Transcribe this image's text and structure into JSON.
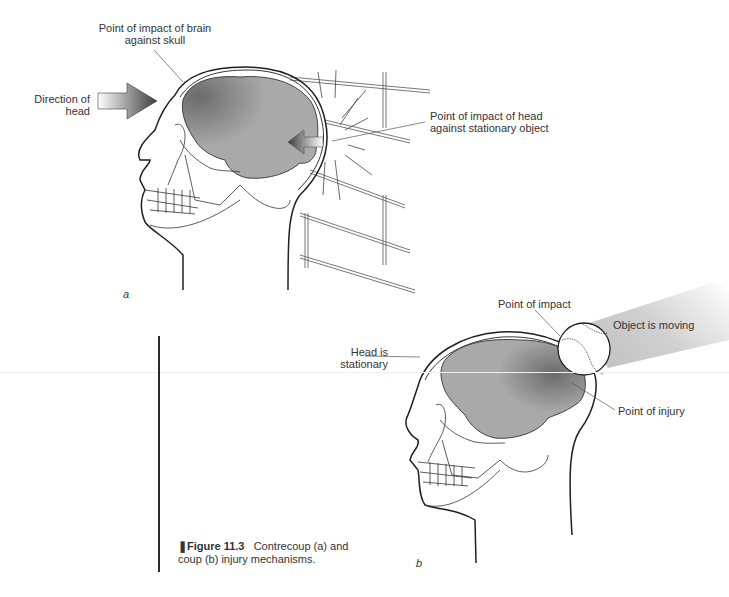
{
  "figure": {
    "number": "Figure 11.3",
    "caption_text": "Contrecoup (a) and coup (b) injury mechanisms.",
    "caption_line1_rest": "Contrecoup (a) and",
    "caption_line2": "coup (b) injury mechanisms."
  },
  "panel_a": {
    "letter": "a",
    "title": "Contrecoup",
    "labels": {
      "brain_impact_line1": "Point of impact of brain",
      "brain_impact_line2": "against skull",
      "direction_line1": "Direction of",
      "direction_line2": "head",
      "head_impact_line1": "Point of impact of head",
      "head_impact_line2": "against stationary object"
    }
  },
  "panel_b": {
    "letter": "b",
    "title": "Coup",
    "labels": {
      "point_of_impact": "Point of impact",
      "object_moving": "Object is moving",
      "head_stationary_line1": "Head is",
      "head_stationary_line2": "stationary",
      "point_of_injury": "Point of injury"
    }
  },
  "colors": {
    "brain_fill": "#a9a9a9",
    "brain_dark": "#6b6b6b",
    "outline": "#1f1f1f",
    "arrow_dark": "#3d3d3d",
    "motion_trail": "#cfcfcf"
  }
}
